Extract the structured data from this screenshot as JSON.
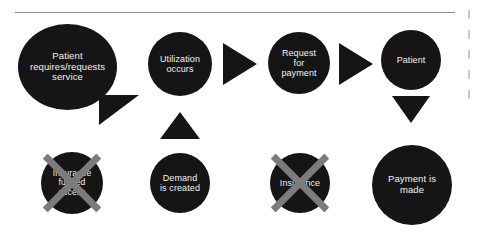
{
  "diagram": {
    "colors": {
      "node_fill": "#151515",
      "node_text": "#f2f2f2",
      "cross_out": "#7c7c7c",
      "rule": "#8c8c8c",
      "background": "#ffffff"
    },
    "rule": {
      "label": "horizontal-divider"
    },
    "nodes": [
      {
        "id": "patient-requires",
        "label": "Patient\nrequires/requests\nservice",
        "crossed_out": false
      },
      {
        "id": "utilization-occurs",
        "label": "Utilization\noccurs",
        "crossed_out": false
      },
      {
        "id": "request-for-payment",
        "label": "Request\nfor\npayment",
        "crossed_out": false
      },
      {
        "id": "patient",
        "label": "Patient",
        "crossed_out": false
      },
      {
        "id": "insurance-funded-access",
        "label": "Insurance\nfunded\naccess",
        "crossed_out": true
      },
      {
        "id": "demand-is-created",
        "label": "Demand\nis created",
        "crossed_out": false
      },
      {
        "id": "insurance",
        "label": "Insurance",
        "crossed_out": true
      },
      {
        "id": "payment-is-made",
        "label": "Payment is\nmade",
        "crossed_out": false
      }
    ],
    "connectors": [
      {
        "id": "connector-patient-to-insurance-access",
        "shape": "triangle-down-right"
      },
      {
        "id": "connector-demand-to-utilization",
        "shape": "triangle-up"
      },
      {
        "id": "connector-utilization-to-request",
        "shape": "triangle-right"
      },
      {
        "id": "connector-request-to-patient",
        "shape": "triangle-right"
      },
      {
        "id": "connector-patient-to-payment",
        "shape": "triangle-down"
      }
    ],
    "edge_fragments": {
      "count": 5,
      "label": "clipped-adjacent-text"
    }
  }
}
